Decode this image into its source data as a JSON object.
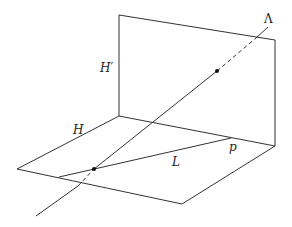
{
  "labels": {
    "lambda": "Λ",
    "h_prime": "H′",
    "h": "H",
    "l": "L",
    "p": "p"
  },
  "colors": {
    "line": "#333333",
    "background": "#ffffff"
  }
}
